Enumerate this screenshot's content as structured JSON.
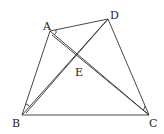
{
  "diagram": {
    "points": {
      "A": {
        "label": "A",
        "x": 50,
        "y": 31
      },
      "B": {
        "label": "B",
        "x": 22,
        "y": 115
      },
      "C": {
        "label": "C",
        "x": 149,
        "y": 115
      },
      "D": {
        "label": "D",
        "x": 108,
        "y": 19
      },
      "E": {
        "label": "E",
        "x": 76,
        "y": 62
      }
    },
    "segments": [
      "AB",
      "AD",
      "DC",
      "BC",
      "AC",
      "BD",
      "BD'"
    ],
    "stroke_color": "#333333"
  }
}
